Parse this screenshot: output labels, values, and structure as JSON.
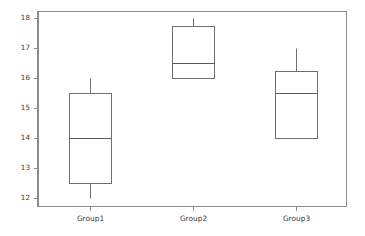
{
  "chart_data": {
    "type": "table",
    "chart_kind": "boxplot",
    "title": "",
    "subtitle": "",
    "xlabel": "",
    "ylabel": "",
    "categories": [
      "Group1",
      "Group2",
      "Group3"
    ],
    "ylim": [
      11.7,
      18.25
    ],
    "yticks": [
      12,
      13,
      14,
      15,
      16,
      17,
      18
    ],
    "ytick_labels": [
      "12",
      "13",
      "14",
      "15",
      "16",
      "17",
      "18"
    ],
    "grid": false,
    "legend": false,
    "legend_position": "none",
    "axis_color": "#8c8c8c",
    "box_edge_color": "#6e6e6e",
    "box_fill_color": "#ffffff",
    "median_color": "#5a5a5a",
    "whisker_color": "#6e6e6e",
    "background_color": "#ffffff",
    "boxes": [
      {
        "label": "Group1",
        "whisker_low": 12.0,
        "q1": 12.5,
        "median": 14.0,
        "q3": 15.5,
        "whisker_high": 16.0,
        "outliers": []
      },
      {
        "label": "Group2",
        "whisker_low": 16.0,
        "q1": 16.0,
        "median": 16.5,
        "q3": 17.75,
        "whisker_high": 18.0,
        "outliers": []
      },
      {
        "label": "Group3",
        "whisker_low": 14.0,
        "q1": 14.0,
        "median": 15.5,
        "q3": 16.25,
        "whisker_high": 17.0,
        "outliers": []
      }
    ]
  },
  "geometry": {
    "plot_left": 38,
    "plot_right": 347,
    "plot_top": 11,
    "plot_bottom": 207,
    "box_width": 42,
    "show_whisker_caps": false,
    "ytick_len": 4,
    "xtick_len": 4,
    "ytick_label_gap": 7,
    "xtick_label_gap": 4
  }
}
